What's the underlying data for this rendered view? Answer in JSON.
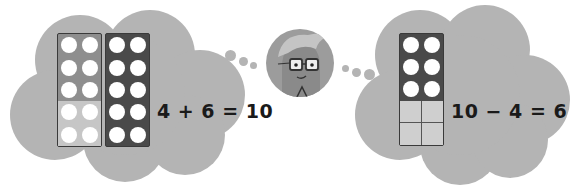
{
  "colors": {
    "cloud": "#b4b4b4",
    "frame_dark": "#4a4a4a",
    "frame_medium": "#8e8e8e",
    "frame_light": "#c6c6c6",
    "counter": "#ffffff",
    "text": "#1a1a1a"
  },
  "left_panel": {
    "equation": "4 + 6 = 10",
    "frames": [
      {
        "label": "ten-frame-mixed",
        "counters": 10,
        "top_rows_shade": "medium",
        "bottom_rows_shade": "light"
      },
      {
        "label": "ten-frame-full",
        "counters": 10,
        "shade": "dark"
      }
    ]
  },
  "right_panel": {
    "equation": "10 − 4 = 6",
    "frame": {
      "label": "ten-frame-partial",
      "counters": 6,
      "empty_cells": 4
    }
  },
  "character": {
    "name": "teacher-avatar",
    "description": "boy with glasses"
  }
}
